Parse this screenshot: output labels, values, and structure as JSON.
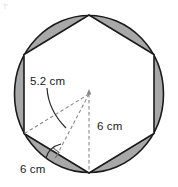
{
  "figure": {
    "background_color": "#ffffff",
    "outline_color": "#1a1a1a",
    "segment_fill_color": "#a8a8a8",
    "hexagon_fill_color": "#ffffff",
    "dash_color": "#7a7a7a",
    "text_color": "#1a1a1a"
  },
  "labels": {
    "apothem": "5.2 cm",
    "radius": "6 cm",
    "side": "6 cm"
  },
  "geometry": {
    "circle": {
      "center_x": 89,
      "center_y": 94,
      "radius_x": 75,
      "radius_y": 79
    },
    "hexagon": {
      "sides": 6,
      "orientation": "pointy-top",
      "vertices": [
        {
          "x": 89,
          "y": 15
        },
        {
          "x": 154,
          "y": 54
        },
        {
          "x": 154,
          "y": 134
        },
        {
          "x": 89,
          "y": 173
        },
        {
          "x": 24,
          "y": 134
        },
        {
          "x": 24,
          "y": 54
        }
      ]
    },
    "construction": {
      "center": {
        "x": 89,
        "y": 94
      },
      "radius_endpoint": {
        "x": 24,
        "y": 134
      },
      "vertical_endpoint": {
        "x": 89,
        "y": 173
      },
      "apothem_endpoint": {
        "x": 56.5,
        "y": 153.5
      },
      "right_angle_marker_size": 9
    }
  }
}
